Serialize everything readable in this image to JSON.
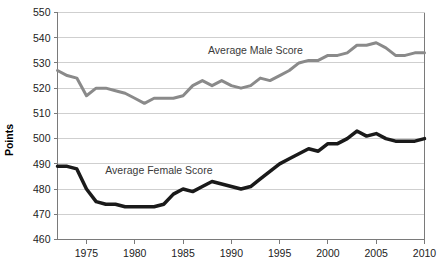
{
  "chart_data": {
    "type": "line",
    "title": "",
    "subtitle": "",
    "xlabel": "",
    "ylabel": "Points",
    "xlim": [
      1972,
      2010
    ],
    "ylim": [
      460,
      550
    ],
    "grid": true,
    "grid_axis": "y",
    "legend_position": "inline-annotation",
    "x_ticks": [
      1975,
      1980,
      1985,
      1990,
      1995,
      2000,
      2005,
      2010
    ],
    "x_tick_labels": [
      "1975",
      "1980",
      "1985",
      "1990",
      "1995",
      "2000",
      "2005",
      "2010"
    ],
    "y_ticks": [
      460,
      470,
      480,
      490,
      500,
      510,
      520,
      530,
      540,
      550
    ],
    "y_tick_labels": [
      "460",
      "470",
      "480",
      "490",
      "500",
      "510",
      "520",
      "530",
      "540",
      "550"
    ],
    "x": [
      1972,
      1973,
      1974,
      1975,
      1976,
      1977,
      1978,
      1979,
      1980,
      1981,
      1982,
      1983,
      1984,
      1985,
      1986,
      1987,
      1988,
      1989,
      1990,
      1991,
      1992,
      1993,
      1994,
      1995,
      1996,
      1997,
      1998,
      1999,
      2000,
      2001,
      2002,
      2003,
      2004,
      2005,
      2006,
      2007,
      2008,
      2009,
      2010
    ],
    "series": [
      {
        "name": "Average Male Score",
        "color": "#8a8a8a",
        "line_width": 3,
        "label_x": 1992.5,
        "label_y": 533.5,
        "values": [
          527,
          525,
          524,
          517,
          520,
          520,
          519,
          518,
          516,
          514,
          516,
          516,
          516,
          517,
          521,
          523,
          521,
          523,
          521,
          520,
          521,
          524,
          523,
          525,
          527,
          530,
          531,
          531,
          533,
          533,
          534,
          537,
          537,
          538,
          536,
          533,
          533,
          534,
          534
        ]
      },
      {
        "name": "Average Female Score",
        "color": "#1a1a1a",
        "line_width": 3.5,
        "label_x": 1982.5,
        "label_y": 486,
        "values": [
          489,
          489,
          488,
          480,
          475,
          474,
          474,
          473,
          473,
          473,
          473,
          474,
          478,
          480,
          479,
          481,
          483,
          482,
          481,
          480,
          481,
          484,
          487,
          490,
          492,
          494,
          496,
          495,
          498,
          498,
          500,
          503,
          501,
          502,
          500,
          499,
          499,
          499,
          500
        ]
      }
    ],
    "annotations": [
      {
        "text": "Average Male Score",
        "x": 1992.5,
        "y": 533.5
      },
      {
        "text": "Average Female Score",
        "x": 1982.5,
        "y": 486
      }
    ]
  },
  "axes": {
    "y_title": "Points"
  }
}
